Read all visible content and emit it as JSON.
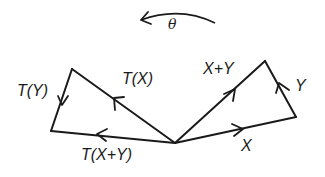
{
  "diagram": {
    "title": "",
    "rotation": {
      "symbol": "θ",
      "direction": "counterclockwise"
    },
    "vertices": {
      "origin": [
        175,
        143
      ],
      "X": [
        296,
        117
      ],
      "X_plus_Y": [
        265,
        61
      ],
      "T_X": [
        72,
        69
      ],
      "T_X_plus_Y": [
        51,
        131
      ]
    },
    "edges": [
      {
        "id": "X",
        "label": "X",
        "from": "origin",
        "to": "X"
      },
      {
        "id": "Y",
        "label": "Y",
        "from": "X",
        "to": "X_plus_Y"
      },
      {
        "id": "X_plus_Y",
        "label": "X+Y",
        "from": "origin",
        "to": "X_plus_Y"
      },
      {
        "id": "T_X",
        "label": "T(X)",
        "from": "origin",
        "to": "T_X"
      },
      {
        "id": "T_Y",
        "label": "T(Y)",
        "from": "T_X",
        "to": "T_X_plus_Y"
      },
      {
        "id": "T_X_plus_Y",
        "label": "T(X+Y)",
        "from": "origin",
        "to": "T_X_plus_Y"
      }
    ],
    "labels": {
      "theta": "θ",
      "x": "X",
      "y": "Y",
      "x_plus_y": "X+Y",
      "t_x": "T(X)",
      "t_y": "T(Y)",
      "t_x_plus_y": "T(X+Y)"
    },
    "colors": {
      "stroke": "#1a1a1a",
      "background": "#ffffff"
    }
  }
}
